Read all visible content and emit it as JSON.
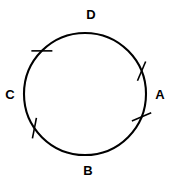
{
  "figure": {
    "kind": "geometry-diagram",
    "background_color": "#ffffff",
    "stroke_color": "#000000"
  },
  "circle": {
    "center_x": 85,
    "center_y": 94,
    "radius": 61,
    "stroke_width": 2.1,
    "fill": "none"
  },
  "labels": [
    {
      "id": "label-d",
      "text": "D",
      "x": 91,
      "y": 16,
      "angle_deg": 97
    },
    {
      "id": "label-a",
      "text": "A",
      "x": 160,
      "y": 96,
      "angle_deg": 0
    },
    {
      "id": "label-b",
      "text": "B",
      "x": 88,
      "y": 172,
      "angle_deg": 272
    },
    {
      "id": "label-c",
      "text": "C",
      "x": 10,
      "y": 96,
      "angle_deg": 180
    }
  ],
  "tick_marks": [
    {
      "id": "tick-upper-left",
      "angle_deg": 135,
      "length": 21,
      "stroke_width": 1.6
    },
    {
      "id": "tick-lower-left",
      "angle_deg": 214,
      "length": 21,
      "stroke_width": 1.6
    },
    {
      "id": "tick-a-upper",
      "angle_deg": 22,
      "length": 21,
      "stroke_width": 1.6
    },
    {
      "id": "tick-a-lower",
      "angle_deg": 338,
      "length": 21,
      "stroke_width": 1.6
    }
  ],
  "chart_data": {
    "type": "scatter",
    "xlabel": "",
    "ylabel": "",
    "categories": [
      "A",
      "B",
      "C",
      "D"
    ],
    "series": [
      {
        "name": "labelled points on circle",
        "values": [
          0,
          272,
          180,
          97
        ]
      },
      {
        "name": "tick mark positions (degrees)",
        "values": [
          22,
          338,
          135,
          214
        ]
      }
    ],
    "annotations": [
      "Single tick mark at 135 degrees (upper left arc)",
      "Single tick mark at 214 degrees (lower left arc)",
      "Tick mark at 22 degrees just above point A",
      "Tick mark at 338 degrees just below point A"
    ],
    "legend_position": "none",
    "grid": false
  }
}
